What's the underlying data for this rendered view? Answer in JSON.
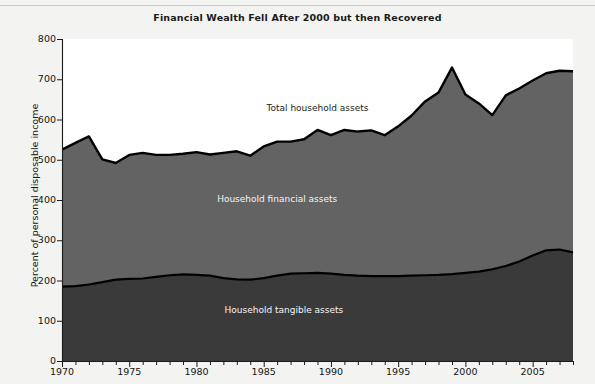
{
  "figure": {
    "title": "Financial Wealth Fell After 2000 but then Recovered",
    "background_color": "#f3f3f1",
    "plot_background_color": "#ffffff"
  },
  "chart_data": {
    "type": "area",
    "title": "Financial Wealth Fell After 2000 but then Recovered",
    "xlabel": "",
    "ylabel": "Percent of personal disposable income",
    "xlim": [
      1970,
      2008
    ],
    "ylim": [
      0,
      800
    ],
    "ytick_step": 100,
    "yticks": [
      0,
      100,
      200,
      300,
      400,
      500,
      600,
      700,
      800
    ],
    "xticks_labeled": [
      1970,
      1975,
      1980,
      1985,
      1990,
      1995,
      2000,
      2005
    ],
    "xticks_minor_interval": 1,
    "grid": false,
    "legend_position": "inline-annotations",
    "stacked": true,
    "x": [
      1970,
      1971,
      1972,
      1973,
      1974,
      1975,
      1976,
      1977,
      1978,
      1979,
      1980,
      1981,
      1982,
      1983,
      1984,
      1985,
      1986,
      1987,
      1988,
      1989,
      1990,
      1991,
      1992,
      1993,
      1994,
      1995,
      1996,
      1997,
      1998,
      1999,
      2000,
      2001,
      2002,
      2003,
      2004,
      2005,
      2006,
      2007,
      2008
    ],
    "series": [
      {
        "name": "Household tangible assets",
        "color": "#3a3a3a",
        "values": [
          185,
          186,
          190,
          196,
          202,
          204,
          205,
          209,
          213,
          215,
          214,
          212,
          206,
          203,
          202,
          206,
          212,
          217,
          218,
          219,
          217,
          214,
          212,
          211,
          211,
          211,
          212,
          213,
          214,
          216,
          219,
          222,
          228,
          236,
          247,
          262,
          275,
          277,
          270
        ]
      },
      {
        "name": "Household financial assets",
        "color": "#636363",
        "values": [
          340,
          356,
          368,
          305,
          290,
          308,
          312,
          303,
          299,
          300,
          305,
          301,
          311,
          318,
          308,
          327,
          333,
          328,
          333,
          355,
          344,
          360,
          358,
          362,
          350,
          372,
          398,
          432,
          453,
          513,
          443,
          418,
          383,
          424,
          430,
          435,
          440,
          444,
          450
        ]
      }
    ],
    "total_series": {
      "name": "Total household assets",
      "values": [
        525,
        542,
        558,
        501,
        492,
        512,
        517,
        512,
        512,
        515,
        519,
        513,
        517,
        521,
        510,
        533,
        545,
        545,
        551,
        574,
        561,
        574,
        570,
        573,
        561,
        583,
        610,
        645,
        667,
        729,
        662,
        640,
        611,
        660,
        677,
        697,
        715,
        721,
        720
      ]
    },
    "annotations": [
      {
        "name": "Total household assets",
        "x": 1989.0,
        "y": 625,
        "color": "#1c1c1c"
      },
      {
        "name": "Household financial assets",
        "x": 1986.0,
        "y": 400,
        "color": "#f4f4f4"
      },
      {
        "name": "Household tangible assets",
        "x": 1986.5,
        "y": 125,
        "color": "#f4f4f4"
      }
    ]
  },
  "axes": {
    "y_tick_labels": [
      "800",
      "700",
      "600",
      "500",
      "400",
      "300",
      "200",
      "100",
      "0"
    ],
    "x_tick_labels": [
      "1970",
      "1975",
      "1980",
      "1985",
      "1990",
      "1995",
      "2000",
      "2005"
    ],
    "y_axis_title": "Percent of personal disposable income"
  },
  "annotations": {
    "total": "Total household assets",
    "financial": "Household financial assets",
    "tangible": "Household tangible assets"
  }
}
